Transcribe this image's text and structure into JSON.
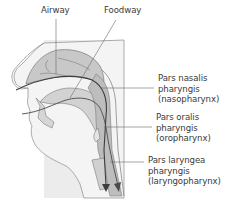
{
  "diagram": {
    "type": "anatomical-cross-section",
    "colors": {
      "background_panel": "#ececec",
      "tissue_fill": "#c8c8c8",
      "tissue_light": "#dedede",
      "outline": "#7a7a7a",
      "pathway_line": "#404040",
      "leader_line": "#6a6a6a",
      "text": "#3a3a3a"
    },
    "top_labels": {
      "airway": "Airway",
      "foodway": "Foodway"
    },
    "side_labels": [
      {
        "line1": "Pars nasalis",
        "line2": "pharyngis",
        "line3": "(nasopharynx)"
      },
      {
        "line1": "Pars oralis",
        "line2": "pharyngis",
        "line3": "(oropharynx)"
      },
      {
        "line1": "Pars laryngea",
        "line2": "pharyngis",
        "line3": "(laryngopharynx)"
      }
    ]
  }
}
